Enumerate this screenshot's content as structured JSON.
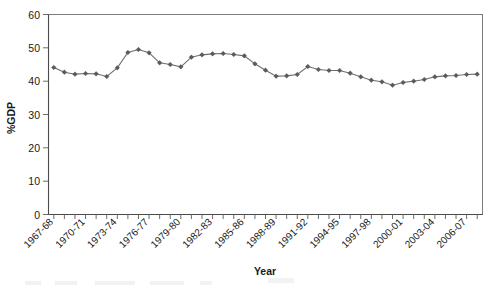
{
  "chart_data": {
    "type": "line",
    "title": "",
    "xlabel": "Year",
    "ylabel": "%GDP",
    "ylim": [
      0,
      60
    ],
    "ytick_step": 10,
    "yticks": [
      0,
      10,
      20,
      30,
      40,
      50,
      60
    ],
    "grid": false,
    "legend": null,
    "marker": "diamond",
    "line_color": "#6e6e6e",
    "marker_color": "#5a5a5a",
    "categories": [
      "1967-68",
      "1968-69",
      "1969-70",
      "1970-71",
      "1971-72",
      "1972-73",
      "1973-74",
      "1974-75",
      "1975-76",
      "1976-77",
      "1977-78",
      "1978-79",
      "1979-80",
      "1980-81",
      "1981-82",
      "1982-83",
      "1983-84",
      "1984-85",
      "1985-86",
      "1986-87",
      "1987-88",
      "1988-89",
      "1989-90",
      "1990-91",
      "1991-92",
      "1992-93",
      "1993-94",
      "1994-95",
      "1995-96",
      "1996-97",
      "1997-98",
      "1998-99",
      "1999-00",
      "2000-01",
      "2001-02",
      "2002-03",
      "2003-04",
      "2004-05",
      "2005-06",
      "2006-07",
      "2007-08"
    ],
    "xtick_labels_shown": [
      "1967-68",
      "1970-71",
      "1973-74",
      "1976-77",
      "1979-80",
      "1982-83",
      "1985-86",
      "1988-89",
      "1991-92",
      "1994-95",
      "1997-98",
      "2000-01",
      "2003-04",
      "2006-07"
    ],
    "xtick_label_interval": 3,
    "values": [
      44.1,
      42.7,
      42.1,
      42.3,
      42.2,
      41.4,
      44.0,
      48.6,
      49.5,
      48.5,
      45.5,
      45.0,
      44.3,
      47.2,
      47.9,
      48.2,
      48.3,
      48.0,
      47.6,
      45.2,
      43.3,
      41.5,
      41.6,
      42.0,
      44.4,
      43.5,
      43.2,
      43.2,
      42.4,
      41.3,
      40.3,
      39.8,
      38.8,
      39.6,
      40.0,
      40.5,
      41.3,
      41.6,
      41.7,
      42.0,
      42.1
    ]
  },
  "axes": {
    "y_axis_title": "%GDP",
    "x_axis_title": "Year",
    "y_tick_0": "0",
    "y_tick_10": "10",
    "y_tick_20": "20",
    "y_tick_30": "30",
    "y_tick_40": "40",
    "y_tick_50": "50",
    "y_tick_60": "60"
  }
}
